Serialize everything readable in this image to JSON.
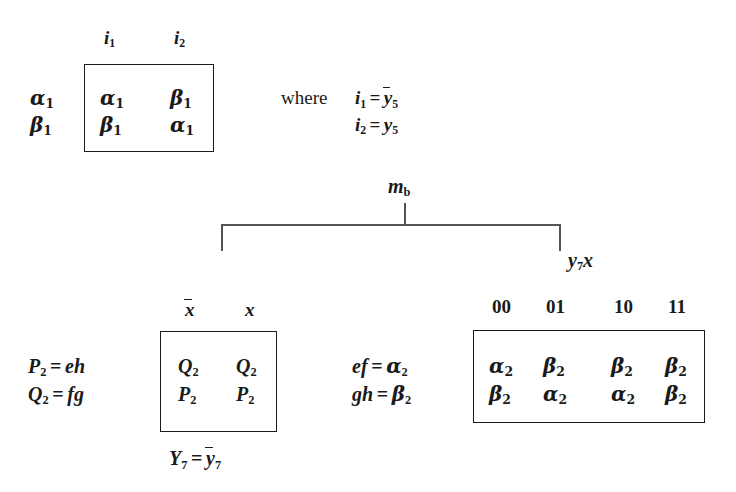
{
  "page": {
    "background": "#ffffff",
    "ink": "#1a1a1a",
    "rule_color": "#555555"
  },
  "top_matrix": {
    "name": "alpha-beta-matrix-1",
    "column_headers": [
      "i1",
      "i2"
    ],
    "column_headers_text": [
      "i",
      "i"
    ],
    "column_header_subs": [
      "1",
      "2"
    ],
    "row_labels_text": [
      "α",
      "β"
    ],
    "row_label_subs": [
      "1",
      "1"
    ],
    "cells": [
      [
        {
          "sym": "α",
          "sub": "1"
        },
        {
          "sym": "β",
          "sub": "1"
        }
      ],
      [
        {
          "sym": "β",
          "sub": "1"
        },
        {
          "sym": "α",
          "sub": "1"
        }
      ]
    ]
  },
  "where_clause": {
    "keyword": "where",
    "lines": [
      {
        "lhs": "i",
        "lhs_sub": "1",
        "op": "=",
        "rhs": "y",
        "rhs_sub": "5",
        "rhs_overline": true
      },
      {
        "lhs": "i",
        "lhs_sub": "2",
        "op": "=",
        "rhs": "y",
        "rhs_sub": "5",
        "rhs_overline": false
      }
    ]
  },
  "bracket": {
    "top_label": "m",
    "top_label_sub": "b",
    "end_label": "y",
    "end_label_sub": "7",
    "end_label_tail": "x"
  },
  "bottom_left": {
    "name": "pq-matrix",
    "equations": [
      {
        "lhs": "P",
        "lhs_sub": "2",
        "op": "=",
        "rhs": "eh"
      },
      {
        "lhs": "Q",
        "lhs_sub": "2",
        "op": "=",
        "rhs": "fg"
      }
    ],
    "column_headers": [
      {
        "sym": "x",
        "overline": true
      },
      {
        "sym": "x",
        "overline": false
      }
    ],
    "cells": [
      [
        {
          "sym": "Q",
          "sub": "2"
        },
        {
          "sym": "Q",
          "sub": "2"
        }
      ],
      [
        {
          "sym": "P",
          "sub": "2"
        },
        {
          "sym": "P",
          "sub": "2"
        }
      ]
    ],
    "caption": {
      "lhs": "Y",
      "lhs_sub": "7",
      "op": "=",
      "rhs": "y",
      "rhs_sub": "7",
      "rhs_overline": true
    }
  },
  "bottom_right": {
    "name": "alpha-beta-matrix-2",
    "equations": [
      {
        "lhs": "ef",
        "op": "=",
        "rhs": "α",
        "rhs_sub": "2"
      },
      {
        "lhs": "gh",
        "op": "=",
        "rhs": "β",
        "rhs_sub": "2"
      }
    ],
    "column_headers": [
      "00",
      "01",
      "10",
      "11"
    ],
    "cells": [
      [
        {
          "sym": "α",
          "sub": "2"
        },
        {
          "sym": "β",
          "sub": "2"
        },
        {
          "sym": "β",
          "sub": "2"
        },
        {
          "sym": "β",
          "sub": "2"
        }
      ],
      [
        {
          "sym": "β",
          "sub": "2"
        },
        {
          "sym": "α",
          "sub": "2"
        },
        {
          "sym": "α",
          "sub": "2"
        },
        {
          "sym": "β",
          "sub": "2"
        }
      ]
    ]
  }
}
